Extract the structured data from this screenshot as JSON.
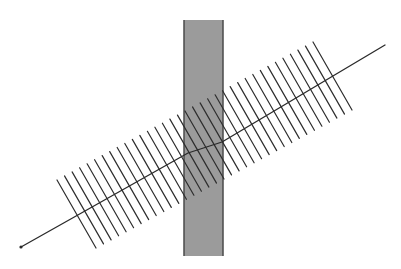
{
  "figure": {
    "width": 401,
    "height": 269,
    "background": "#ffffff"
  },
  "band": {
    "x": 184,
    "y": 20,
    "width": 39,
    "height": 236,
    "fill": "#9b9b9b",
    "edge_color": "#4a4a4a",
    "edge_width": 1.5
  },
  "main_line": {
    "points": [
      [
        21,
        247
      ],
      [
        188,
        153
      ],
      [
        222,
        142
      ],
      [
        385,
        45
      ]
    ],
    "color": "#2a2a2a",
    "width": 1.3,
    "start_dot_radius": 1.6
  },
  "hatching": {
    "count": 35,
    "first_top": [
      57,
      180
    ],
    "last_top": [
      313,
      42
    ],
    "dx": 39,
    "dy": 68,
    "color": "#2e2e2e",
    "width": 1.2
  }
}
